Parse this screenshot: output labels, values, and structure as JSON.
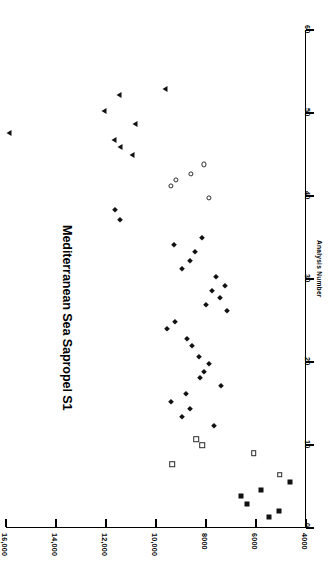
{
  "chart_data": {
    "type": "scatter",
    "title": "Mediterranean Sea Sapropel S1",
    "xlabel": "Analysis  Number",
    "ylabel": "",
    "orientation": "rotated-90-clockwise",
    "xlim": [
      0,
      60
    ],
    "ylim": [
      4000,
      16000
    ],
    "xticks": [
      0,
      10,
      20,
      30,
      40,
      50,
      60
    ],
    "yticks": [
      4000,
      6000,
      8000,
      10000,
      12000,
      14000,
      16000
    ],
    "xticklabels": [
      "0",
      "10",
      "20",
      "30",
      "40",
      "50",
      "60"
    ],
    "yticklabels": [
      "4000",
      "6000",
      "8000",
      "10,000",
      "12,000",
      "14,000",
      "16,000"
    ],
    "grid": false,
    "legend": "none",
    "series": [
      {
        "name": "filled-square",
        "marker": "filled-square",
        "points": [
          {
            "x": 1.3,
            "y": 5500
          },
          {
            "x": 2.1,
            "y": 5100
          },
          {
            "x": 2.9,
            "y": 6350
          },
          {
            "x": 3.9,
            "y": 6600
          },
          {
            "x": 4.6,
            "y": 5800
          },
          {
            "x": 5.6,
            "y": 4650
          }
        ]
      },
      {
        "name": "open-square",
        "marker": "open-square",
        "points": [
          {
            "x": 6.4,
            "y": 5050
          },
          {
            "x": 7.7,
            "y": 9350
          },
          {
            "x": 9.0,
            "y": 6100
          },
          {
            "x": 10.0,
            "y": 8150
          },
          {
            "x": 10.7,
            "y": 8400
          }
        ]
      },
      {
        "name": "filled-diamond",
        "marker": "filled-diamond",
        "points": [
          {
            "x": 12.3,
            "y": 7700
          },
          {
            "x": 13.4,
            "y": 8950
          },
          {
            "x": 14.3,
            "y": 8650
          },
          {
            "x": 15.2,
            "y": 9400
          },
          {
            "x": 16.2,
            "y": 8800
          },
          {
            "x": 17.1,
            "y": 7400
          },
          {
            "x": 18.1,
            "y": 8250
          },
          {
            "x": 18.8,
            "y": 8100
          },
          {
            "x": 19.8,
            "y": 7900
          },
          {
            "x": 20.6,
            "y": 8300
          },
          {
            "x": 21.9,
            "y": 8550
          },
          {
            "x": 22.8,
            "y": 8750
          },
          {
            "x": 24.0,
            "y": 9550
          },
          {
            "x": 24.8,
            "y": 9250
          },
          {
            "x": 26.1,
            "y": 7150
          },
          {
            "x": 26.9,
            "y": 8000
          },
          {
            "x": 27.7,
            "y": 7450
          },
          {
            "x": 28.5,
            "y": 7750
          },
          {
            "x": 29.2,
            "y": 7250
          },
          {
            "x": 30.3,
            "y": 7600
          },
          {
            "x": 31.2,
            "y": 8950
          },
          {
            "x": 32.2,
            "y": 8650
          },
          {
            "x": 33.2,
            "y": 8450
          },
          {
            "x": 34.1,
            "y": 9300
          },
          {
            "x": 34.9,
            "y": 8150
          },
          {
            "x": 37.1,
            "y": 11450
          },
          {
            "x": 38.3,
            "y": 11650
          }
        ]
      },
      {
        "name": "open-circle",
        "marker": "open-circle",
        "points": [
          {
            "x": 39.8,
            "y": 7900
          },
          {
            "x": 41.2,
            "y": 9400
          },
          {
            "x": 41.9,
            "y": 9200
          },
          {
            "x": 42.7,
            "y": 8600
          },
          {
            "x": 43.8,
            "y": 8100
          }
        ]
      },
      {
        "name": "filled-triangle",
        "marker": "filled-triangle",
        "points": [
          {
            "x": 45.0,
            "y": 10950
          },
          {
            "x": 45.9,
            "y": 11450
          },
          {
            "x": 46.7,
            "y": 11700
          },
          {
            "x": 47.6,
            "y": 15900
          },
          {
            "x": 48.7,
            "y": 10850
          },
          {
            "x": 50.2,
            "y": 12100
          },
          {
            "x": 52.2,
            "y": 11500
          },
          {
            "x": 52.9,
            "y": 9650
          }
        ]
      }
    ]
  },
  "geometry": {
    "value_axis_px": {
      "left": 6,
      "right": 306,
      "vmin_at_left": 16000,
      "vmax_at_right": 4000
    },
    "analysis_axis_px": {
      "top": 30,
      "bottom": 528,
      "amax_at_top": 60,
      "amin_at_bottom": 0
    }
  }
}
